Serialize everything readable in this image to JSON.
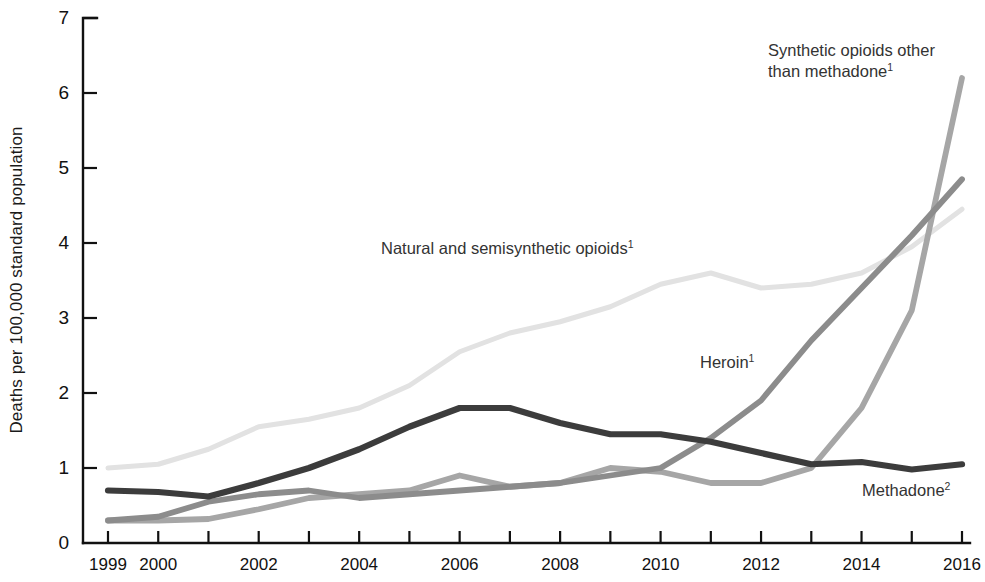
{
  "chart_data": {
    "type": "line",
    "title": "",
    "xlabel": "",
    "ylabel": "Deaths per 100,000 standard population",
    "x": [
      1999,
      2000,
      2001,
      2002,
      2003,
      2004,
      2005,
      2006,
      2007,
      2008,
      2009,
      2010,
      2011,
      2012,
      2013,
      2014,
      2015,
      2016
    ],
    "xlim": [
      1999,
      2016
    ],
    "ylim": [
      0,
      7
    ],
    "ytick_labels": [
      "0",
      "1",
      "2",
      "3",
      "4",
      "5",
      "6",
      "7"
    ],
    "ytick_values": [
      0,
      1,
      2,
      3,
      4,
      5,
      6,
      7
    ],
    "xtick_values": [
      1999,
      2000,
      2001,
      2002,
      2003,
      2004,
      2005,
      2006,
      2007,
      2008,
      2009,
      2010,
      2011,
      2012,
      2013,
      2014,
      2015,
      2016
    ],
    "xtick_labels_shown": [
      "1999",
      "2000",
      "2002",
      "2004",
      "2006",
      "2008",
      "2010",
      "2012",
      "2014",
      "2016"
    ],
    "xtick_labels_shown_values": [
      1999,
      2000,
      2002,
      2004,
      2006,
      2008,
      2010,
      2012,
      2014,
      2016
    ],
    "grid": false,
    "legend_position": "inline-annotations",
    "series": [
      {
        "name": "Natural and semisynthetic opioids",
        "footnote": "1",
        "color": "#e2e2e2",
        "width": 5.0,
        "values": [
          1.0,
          1.05,
          1.25,
          1.55,
          1.65,
          1.8,
          2.1,
          2.55,
          2.8,
          2.95,
          3.15,
          3.45,
          3.6,
          3.4,
          3.45,
          3.6,
          3.95,
          4.45
        ]
      },
      {
        "name": "Methadone",
        "footnote": "2",
        "color": "#3c3c3c",
        "width": 6.2,
        "values": [
          0.7,
          0.68,
          0.62,
          0.8,
          1.0,
          1.25,
          1.55,
          1.8,
          1.8,
          1.6,
          1.45,
          1.45,
          1.35,
          1.2,
          1.05,
          1.08,
          0.98,
          1.05
        ]
      },
      {
        "name": "Heroin",
        "footnote": "1",
        "color": "#8c8c8c",
        "width": 5.8,
        "values": [
          0.3,
          0.35,
          0.55,
          0.65,
          0.7,
          0.6,
          0.65,
          0.7,
          0.75,
          0.8,
          0.9,
          1.0,
          1.4,
          1.9,
          2.7,
          3.4,
          4.1,
          4.85
        ]
      },
      {
        "name": "Synthetic opioids other than methadone",
        "footnote": "1",
        "color": "#a6a6a6",
        "width": 5.8,
        "values": [
          0.3,
          0.3,
          0.32,
          0.45,
          0.6,
          0.65,
          0.7,
          0.9,
          0.75,
          0.8,
          1.0,
          0.95,
          0.8,
          0.8,
          1.0,
          1.8,
          3.1,
          6.2
        ]
      }
    ],
    "annotations": [
      {
        "id": "synthetic-label",
        "text_lines": [
          "Synthetic opioids other",
          "than methadone"
        ],
        "footnote": "1",
        "x_px": 768,
        "y_px": 40
      },
      {
        "id": "natural-label",
        "text_lines": [
          "Natural and semisynthetic opioids"
        ],
        "footnote": "1",
        "x_px": 381,
        "y_px": 238
      },
      {
        "id": "heroin-label",
        "text_lines": [
          "Heroin"
        ],
        "footnote": "1",
        "x_px": 700,
        "y_px": 352
      },
      {
        "id": "methadone-label",
        "text_lines": [
          "Methadone"
        ],
        "footnote": "2",
        "x_px": 862,
        "y_px": 480
      }
    ]
  },
  "geometry": {
    "plot_left": 83,
    "plot_right": 962,
    "plot_top": 18,
    "plot_bottom": 543
  }
}
